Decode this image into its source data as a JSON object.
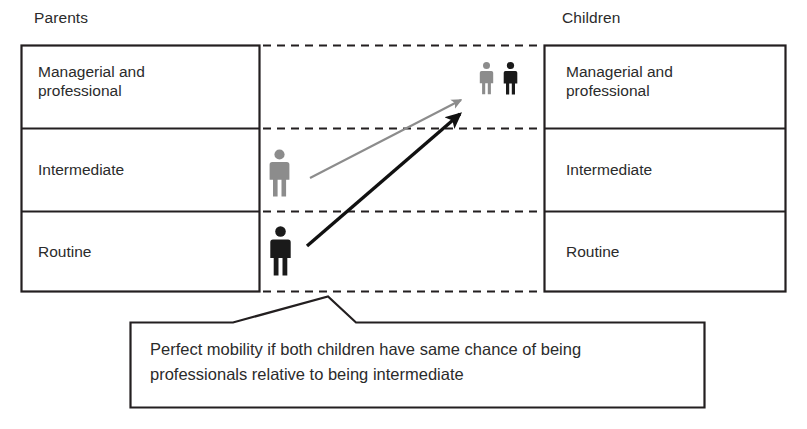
{
  "headers": {
    "left": "Parents",
    "right": "Children"
  },
  "parents_column": {
    "title": "Parents",
    "classes": [
      {
        "label": "Managerial and\nprofessional"
      },
      {
        "label": "Intermediate"
      },
      {
        "label": "Routine"
      }
    ]
  },
  "children_column": {
    "title": "Children",
    "classes": [
      {
        "label": "Managerial and\nprofessional"
      },
      {
        "label": "Intermediate"
      },
      {
        "label": "Routine"
      }
    ]
  },
  "figures": [
    {
      "name": "parent-intermediate-figure",
      "color": "#8c8c8c",
      "origin": "Intermediate",
      "side": "parents"
    },
    {
      "name": "parent-routine-figure",
      "color": "#1a1a1a",
      "origin": "Routine",
      "side": "parents"
    },
    {
      "name": "child-from-intermediate-figure",
      "color": "#8c8c8c",
      "destination": "Managerial and professional",
      "side": "children"
    },
    {
      "name": "child-from-routine-figure",
      "color": "#1a1a1a",
      "destination": "Managerial and professional",
      "side": "children"
    }
  ],
  "arrows": [
    {
      "name": "mobility-arrow-intermediate",
      "color": "#8c8c8c",
      "from": "Intermediate",
      "to": "Managerial and professional"
    },
    {
      "name": "mobility-arrow-routine",
      "color": "#111111",
      "from": "Routine",
      "to": "Managerial and professional"
    }
  ],
  "callout": {
    "text": "Perfect mobility if both children have same chance of being\nprofessionals relative to being intermediate"
  },
  "colors": {
    "stroke": "#231f20",
    "grey_figure": "#8c8c8c",
    "black_figure": "#1a1a1a",
    "background": "#ffffff"
  }
}
